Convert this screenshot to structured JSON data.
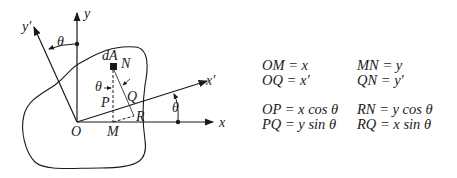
{
  "diagram": {
    "labels": {
      "y": "y",
      "y_prime": "y′",
      "x": "x",
      "x_prime": "x′",
      "origin": "O",
      "M": "M",
      "N": "N",
      "P": "P",
      "Q": "Q",
      "R": "R",
      "dA": "dA",
      "theta_top": "θ",
      "theta_right": "θ",
      "theta_inner": "θ"
    }
  },
  "equations": {
    "group1": [
      {
        "left": "OM = x",
        "right": "MN = y"
      },
      {
        "left": "OQ = x′",
        "right": "QN = y′"
      }
    ],
    "group2": [
      {
        "left": "OP = x cos θ",
        "right": "RN = y cos θ"
      },
      {
        "left": "PQ = y sin θ",
        "right": "RQ = x sin θ"
      }
    ]
  }
}
